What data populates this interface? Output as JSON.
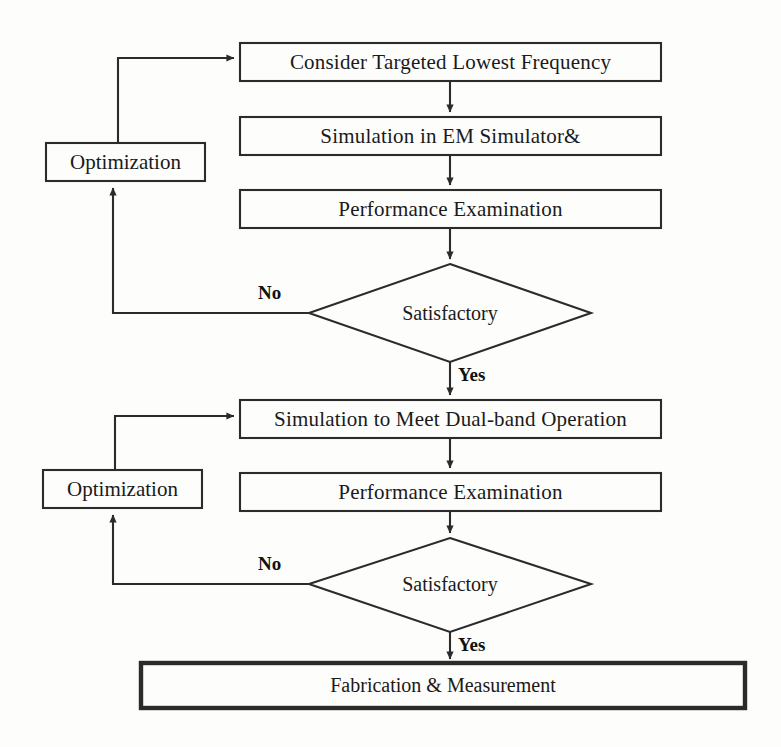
{
  "diagram": {
    "stroke_color": "#2b2b2b",
    "text_color": "#1a1a1a",
    "background_color": "#fdfdfc"
  },
  "nodes": {
    "consider_lowest_freq": {
      "label": "Consider Targeted Lowest Frequency",
      "shape": "process"
    },
    "simulate_em": {
      "label": "Simulation in EM Simulator&",
      "shape": "process"
    },
    "performance_exam_1": {
      "label": "Performance Examination",
      "shape": "process"
    },
    "optimization_1": {
      "label": "Optimization",
      "shape": "process"
    },
    "satisfactory_1": {
      "label": "Satisfactory",
      "shape": "decision"
    },
    "simulate_dualband": {
      "label": "Simulation to Meet Dual-band Operation",
      "shape": "process"
    },
    "performance_exam_2": {
      "label": "Performance Examination",
      "shape": "process"
    },
    "optimization_2": {
      "label": "Optimization",
      "shape": "process"
    },
    "satisfactory_2": {
      "label": "Satisfactory",
      "shape": "decision"
    },
    "fabrication": {
      "label": "Fabrication & Measurement",
      "shape": "terminator"
    }
  },
  "edge_labels": {
    "no_1": "No",
    "yes_1": "Yes",
    "no_2": "No",
    "yes_2": "Yes"
  }
}
